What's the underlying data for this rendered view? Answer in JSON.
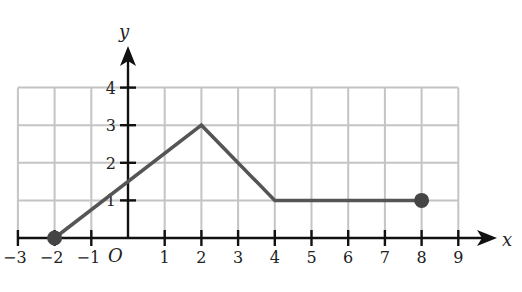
{
  "chart_data": {
    "type": "line",
    "title": "",
    "xlabel": "x",
    "ylabel": "y",
    "origin_label": "O",
    "xlim": [
      -3,
      9
    ],
    "ylim": [
      0,
      4
    ],
    "grid": true,
    "x_ticks": [
      -3,
      -2,
      -1,
      1,
      2,
      3,
      4,
      5,
      6,
      7,
      8,
      9
    ],
    "x_tick_labels": [
      "−3",
      "−2",
      "−1",
      "1",
      "2",
      "3",
      "4",
      "5",
      "6",
      "7",
      "8",
      "9"
    ],
    "y_ticks": [
      1,
      2,
      3,
      4
    ],
    "y_tick_labels": [
      "1",
      "2",
      "3",
      "4"
    ],
    "series": [
      {
        "name": "piecewise-linear graph",
        "x": [
          -2,
          2,
          4,
          8
        ],
        "y": [
          0,
          3,
          1,
          1
        ],
        "color": "#555555",
        "endpoints": [
          {
            "x": -2,
            "y": 0,
            "style": "closed"
          },
          {
            "x": 8,
            "y": 1,
            "style": "closed"
          }
        ]
      }
    ],
    "legend": null
  }
}
